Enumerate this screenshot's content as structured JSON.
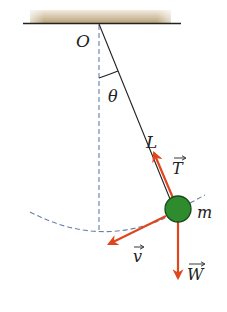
{
  "diagram": {
    "labels": {
      "pivot": "O",
      "angle": "θ",
      "length": "L",
      "mass": "m",
      "tension": "T",
      "velocity": "v",
      "weight": "W"
    },
    "colors": {
      "ceiling": "#c9b48e",
      "line": "#222222",
      "dashed": "#6a7fa8",
      "bob": "#2e8b2e",
      "bob_outline": "#1a4a1a",
      "vector": "#e0461e"
    },
    "elements": {
      "pivot": {
        "x": 99,
        "y": 24
      },
      "bob": {
        "x": 178,
        "y": 210,
        "r": 13
      },
      "ceiling": {
        "x1": 23,
        "x2": 181,
        "y": 23
      }
    }
  }
}
